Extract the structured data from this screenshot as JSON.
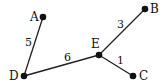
{
  "graph": {
    "nodes": [
      {
        "id": "A",
        "label": "A",
        "x": 43,
        "y": 17,
        "lx": 30,
        "ly": 21
      },
      {
        "id": "B",
        "label": "B",
        "x": 145,
        "y": 9,
        "lx": 150,
        "ly": 13
      },
      {
        "id": "E",
        "label": "E",
        "x": 99,
        "y": 55,
        "lx": 91,
        "ly": 48
      },
      {
        "id": "D",
        "label": "D",
        "x": 24,
        "y": 76,
        "lx": 9,
        "ly": 80
      },
      {
        "id": "C",
        "label": "C",
        "x": 133,
        "y": 76,
        "lx": 139,
        "ly": 80
      }
    ],
    "edges": [
      {
        "from": "A",
        "to": "D",
        "weight": "5",
        "lx": 25,
        "ly": 46
      },
      {
        "from": "E",
        "to": "B",
        "weight": "3",
        "lx": 117,
        "ly": 28
      },
      {
        "from": "D",
        "to": "E",
        "weight": "6",
        "lx": 64,
        "ly": 61
      },
      {
        "from": "E",
        "to": "C",
        "weight": "1",
        "lx": 117,
        "ly": 64
      }
    ],
    "colors": {
      "node": "#111111",
      "edge": "#222222",
      "text": "#111111"
    }
  }
}
